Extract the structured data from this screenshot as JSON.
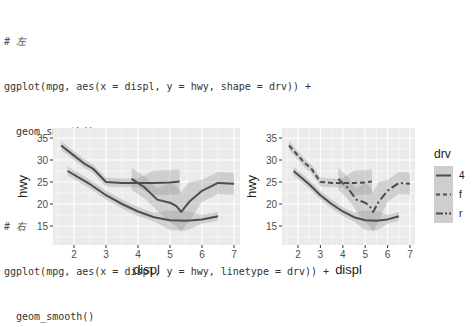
{
  "code": {
    "block_left": {
      "comment": "# 左",
      "line1": "ggplot(mpg, aes(x = displ, y = hwy, shape = drv)) +",
      "line2": "  geom_smooth()"
    },
    "block_right": {
      "comment": "# 右",
      "line1": "ggplot(mpg, aes(x = displ, y = hwy, linetype = drv)) +",
      "line2": "  geom_smooth()"
    }
  },
  "chart_data": [
    {
      "type": "line",
      "title": "",
      "xlabel": "displ",
      "ylabel": "hwy",
      "xlim": [
        1.4,
        7.2
      ],
      "ylim": [
        11,
        36.5
      ],
      "xticks": [
        "2",
        "3",
        "4",
        "5",
        "6",
        "7"
      ],
      "yticks": [
        "15",
        "20",
        "25",
        "30",
        "35"
      ],
      "grid": true,
      "legend": null,
      "series": [
        {
          "name": "4",
          "linetype": "solid",
          "x": [
            1.8,
            2.5,
            3.0,
            3.5,
            4.0,
            4.5,
            5.0,
            5.5,
            6.0,
            6.5
          ],
          "y": [
            27.5,
            24.5,
            22.0,
            20.0,
            18.3,
            17.0,
            16.3,
            16.2,
            16.5,
            17.2
          ]
        },
        {
          "name": "f",
          "linetype": "solid",
          "x": [
            1.6,
            2.0,
            2.3,
            2.6,
            3.0,
            3.5,
            4.0,
            4.5,
            5.0,
            5.3
          ],
          "y": [
            33.3,
            31.0,
            29.3,
            28.0,
            25.0,
            24.8,
            24.8,
            24.8,
            24.9,
            25.1
          ]
        },
        {
          "name": "r",
          "linetype": "solid",
          "x": [
            3.8,
            4.2,
            4.6,
            5.0,
            5.2,
            5.35,
            5.6,
            6.0,
            6.5,
            7.0
          ],
          "y": [
            25.7,
            23.8,
            21.0,
            20.3,
            19.5,
            18.2,
            20.5,
            23.0,
            24.8,
            24.6
          ]
        }
      ]
    },
    {
      "type": "line",
      "title": "",
      "xlabel": "displ",
      "ylabel": "hwy",
      "xlim": [
        1.4,
        7.2
      ],
      "ylim": [
        11,
        36.5
      ],
      "xticks": [
        "2",
        "3",
        "4",
        "5",
        "6",
        "7"
      ],
      "yticks": [
        "15",
        "20",
        "25",
        "30",
        "35"
      ],
      "grid": true,
      "legend": {
        "title": "drv",
        "position": "right",
        "entries": [
          {
            "label": "4",
            "linetype": "solid"
          },
          {
            "label": "f",
            "linetype": "dashed"
          },
          {
            "label": "r",
            "linetype": "longdash"
          }
        ]
      },
      "series": [
        {
          "name": "4",
          "linetype": "solid",
          "x": [
            1.8,
            2.5,
            3.0,
            3.5,
            4.0,
            4.5,
            5.0,
            5.5,
            6.0,
            6.5
          ],
          "y": [
            27.5,
            24.5,
            22.0,
            20.0,
            18.3,
            17.0,
            16.3,
            16.2,
            16.5,
            17.2
          ]
        },
        {
          "name": "f",
          "linetype": "dashed",
          "x": [
            1.6,
            2.0,
            2.3,
            2.6,
            3.0,
            3.5,
            4.0,
            4.5,
            5.0,
            5.3
          ],
          "y": [
            33.3,
            31.0,
            29.3,
            28.0,
            25.0,
            24.8,
            24.8,
            24.8,
            24.9,
            25.1
          ]
        },
        {
          "name": "r",
          "linetype": "longdash",
          "x": [
            3.8,
            4.2,
            4.6,
            5.0,
            5.2,
            5.35,
            5.6,
            6.0,
            6.5,
            7.0
          ],
          "y": [
            25.7,
            23.8,
            21.0,
            20.3,
            19.5,
            18.2,
            20.5,
            23.0,
            24.8,
            24.6
          ]
        }
      ]
    }
  ],
  "legend": {
    "title": "drv",
    "labels": [
      "4",
      "f",
      "r"
    ]
  },
  "colors": {
    "panel_bg": "#ebebeb",
    "grid": "#ffffff",
    "line": "#4d4d4d",
    "ribbon": "#999999"
  }
}
